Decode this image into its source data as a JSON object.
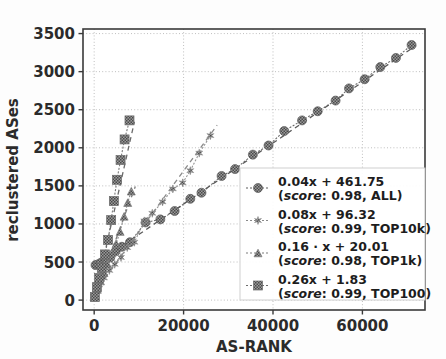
{
  "chart_data": {
    "type": "scatter",
    "title": "",
    "xlabel": "AS-RANK",
    "ylabel": "reclustered ASes",
    "xlim": [
      -2500,
      74000
    ],
    "ylim": [
      -130,
      3560
    ],
    "xticks": [
      0,
      20000,
      40000,
      60000
    ],
    "xticklabels": [
      "0",
      "20000",
      "40000",
      "60000"
    ],
    "yticks": [
      0,
      500,
      1000,
      1500,
      2000,
      2500,
      3000,
      3500
    ],
    "yticklabels": [
      "0",
      "500",
      "1000",
      "1500",
      "2000",
      "2500",
      "3000",
      "3500"
    ],
    "grid": true,
    "grid_style": "dotted",
    "legend_position": "lower right",
    "series": [
      {
        "name": "ALL",
        "label": "0.04x + 461.75",
        "sublabel_prefix": "score",
        "sublabel": ": 0.98, ALL)",
        "score": 0.98,
        "slope": 0.04,
        "intercept": 461.75,
        "marker": "circle-hatched",
        "marker_size": 9,
        "color": "#5a5a5a",
        "linestyle": "dashed",
        "points": [
          [
            300,
            460
          ],
          [
            900,
            470
          ],
          [
            1500,
            490
          ],
          [
            2500,
            520
          ],
          [
            3600,
            560
          ],
          [
            4800,
            640
          ],
          [
            6200,
            700
          ],
          [
            8000,
            760
          ],
          [
            11500,
            1020
          ],
          [
            14800,
            1060
          ],
          [
            18000,
            1170
          ],
          [
            21500,
            1330
          ],
          [
            24000,
            1410
          ],
          [
            28500,
            1630
          ],
          [
            31500,
            1720
          ],
          [
            35500,
            1910
          ],
          [
            39000,
            2030
          ],
          [
            42500,
            2220
          ],
          [
            46500,
            2360
          ],
          [
            50000,
            2480
          ],
          [
            54000,
            2620
          ],
          [
            57000,
            2780
          ],
          [
            60500,
            2900
          ],
          [
            64000,
            3060
          ],
          [
            67500,
            3180
          ],
          [
            71000,
            3350
          ]
        ],
        "fit_x": [
          0,
          72000
        ],
        "fit_y": [
          461.75,
          3343.75
        ]
      },
      {
        "name": "TOP10k",
        "label": "0.08x + 96.32",
        "sublabel_prefix": "score",
        "sublabel": ": 0.99, TOP10k)",
        "score": 0.99,
        "slope": 0.08,
        "intercept": 96.32,
        "marker": "star",
        "marker_size": 8,
        "color": "#8a8a8a",
        "linestyle": "dashed",
        "points": [
          [
            400,
            120
          ],
          [
            1100,
            200
          ],
          [
            2200,
            290
          ],
          [
            3400,
            390
          ],
          [
            4600,
            470
          ],
          [
            6000,
            560
          ],
          [
            7400,
            690
          ],
          [
            9000,
            760
          ],
          [
            11200,
            1040
          ],
          [
            13000,
            1140
          ],
          [
            15300,
            1290
          ],
          [
            17600,
            1460
          ],
          [
            19800,
            1540
          ],
          [
            21500,
            1700
          ],
          [
            23500,
            1930
          ],
          [
            26000,
            2160
          ]
        ],
        "fit_x": [
          0,
          27500
        ],
        "fit_y": [
          96.32,
          2296.32
        ]
      },
      {
        "name": "TOP1k",
        "label": "0.16 · x + 20.01",
        "sublabel_prefix": "score",
        "sublabel": ": 0.98, TOP1k)",
        "score": 0.98,
        "slope": 0.16,
        "intercept": 20.01,
        "marker": "triangle",
        "marker_size": 8,
        "color": "#7d7d7d",
        "linestyle": "dashed",
        "points": [
          [
            200,
            60
          ],
          [
            700,
            140
          ],
          [
            1400,
            250
          ],
          [
            2200,
            360
          ],
          [
            3000,
            470
          ],
          [
            3900,
            620
          ],
          [
            4900,
            740
          ],
          [
            5800,
            900
          ],
          [
            6700,
            1100
          ],
          [
            7500,
            1280
          ],
          [
            8300,
            1430
          ]
        ],
        "fit_x": [
          0,
          9200
        ],
        "fit_y": [
          20.01,
          1492.01
        ]
      },
      {
        "name": "TOP100",
        "label": "0.26x + 1.83",
        "sublabel_prefix": "score",
        "sublabel": ": 0.99, TOP100)",
        "score": 0.99,
        "slope": 0.26,
        "intercept": 1.83,
        "marker": "square",
        "marker_size": 9,
        "color": "#6b6b6b",
        "linestyle": "dashed",
        "points": [
          [
            150,
            40
          ],
          [
            600,
            170
          ],
          [
            1100,
            290
          ],
          [
            1700,
            420
          ],
          [
            2400,
            600
          ],
          [
            3100,
            790
          ],
          [
            3800,
            1050
          ],
          [
            4400,
            1300
          ],
          [
            5100,
            1580
          ],
          [
            5900,
            1840
          ],
          [
            6800,
            2110
          ],
          [
            7900,
            2360
          ]
        ],
        "fit_x": [
          0,
          9000
        ],
        "fit_y": [
          1.83,
          2341.83
        ]
      }
    ]
  },
  "legend": {
    "entries": [
      {
        "title": "0.04x + 461.75",
        "score_word": "score",
        "detail": ": 0.98, ALL)"
      },
      {
        "title": "0.08x + 96.32",
        "score_word": "score",
        "detail": ": 0.99, TOP10k)"
      },
      {
        "title": "0.16 · x + 20.01",
        "score_word": "score",
        "detail": ": 0.98, TOP1k)"
      },
      {
        "title": "0.26x + 1.83",
        "score_word": "score",
        "detail": ": 0.99, TOP100)"
      }
    ]
  },
  "colors": {
    "axis": "#3a3a3a",
    "grid": "#b8b8b8",
    "background": "#fdfdfd",
    "text": "#2b2b2b"
  }
}
